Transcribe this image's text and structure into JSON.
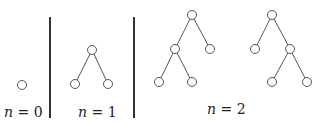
{
  "diagram": {
    "panels": [
      {
        "label_var": "n",
        "label_eq": " = ",
        "label_val": "0",
        "trees": [
          {
            "nodes": [
              [
                22,
                85
              ]
            ],
            "edges": []
          }
        ]
      },
      {
        "label_var": "n",
        "label_eq": " = ",
        "label_val": "1",
        "trees": [
          {
            "nodes": [
              [
                92,
                50
              ],
              [
                75,
                84
              ],
              [
                108,
                84
              ]
            ],
            "edges": [
              [
                0,
                1
              ],
              [
                0,
                2
              ]
            ]
          }
        ]
      },
      {
        "label_var": "n",
        "label_eq": " = ",
        "label_val": "2",
        "trees": [
          {
            "nodes": [
              [
                192,
                15
              ],
              [
                175,
                49
              ],
              [
                210,
                49
              ],
              [
                159,
                82
              ],
              [
                192,
                82
              ]
            ],
            "edges": [
              [
                0,
                1
              ],
              [
                0,
                2
              ],
              [
                1,
                3
              ],
              [
                1,
                4
              ]
            ]
          },
          {
            "nodes": [
              [
                272,
                15
              ],
              [
                255,
                49
              ],
              [
                290,
                49
              ],
              [
                272,
                82
              ],
              [
                307,
                82
              ]
            ],
            "edges": [
              [
                0,
                1
              ],
              [
                0,
                2
              ],
              [
                2,
                3
              ],
              [
                2,
                4
              ]
            ]
          }
        ]
      }
    ],
    "colors": {
      "stroke": "#555555",
      "divider": "#333333",
      "text": "#222222"
    }
  }
}
